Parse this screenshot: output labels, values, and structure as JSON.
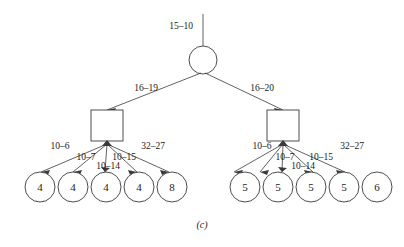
{
  "figure": {
    "caption": "(c)",
    "root_incoming_label": "15–10"
  },
  "nodes": {
    "root": {
      "name": "root-circle",
      "shape": "circle",
      "label": ""
    },
    "left_internal": {
      "name": "left-square",
      "shape": "square",
      "label": ""
    },
    "right_internal": {
      "name": "right-square",
      "shape": "square",
      "label": ""
    }
  },
  "branches": {
    "left_label": "16–19",
    "right_label": "16–20"
  },
  "left_subtree": {
    "edge_labels": [
      "10–6",
      "10–7",
      "10–15",
      "10–14",
      "32–27"
    ],
    "leaf_values": [
      "4",
      "4",
      "4",
      "4",
      "8"
    ]
  },
  "right_subtree": {
    "edge_labels": [
      "10–6",
      "10–7",
      "10–15",
      "10–14",
      "32–27"
    ],
    "leaf_values": [
      "5",
      "5",
      "5",
      "5",
      "6"
    ]
  },
  "colors": {
    "stroke": "#3a3a3a",
    "text": "#1a1a1a",
    "background": "#ffffff"
  }
}
